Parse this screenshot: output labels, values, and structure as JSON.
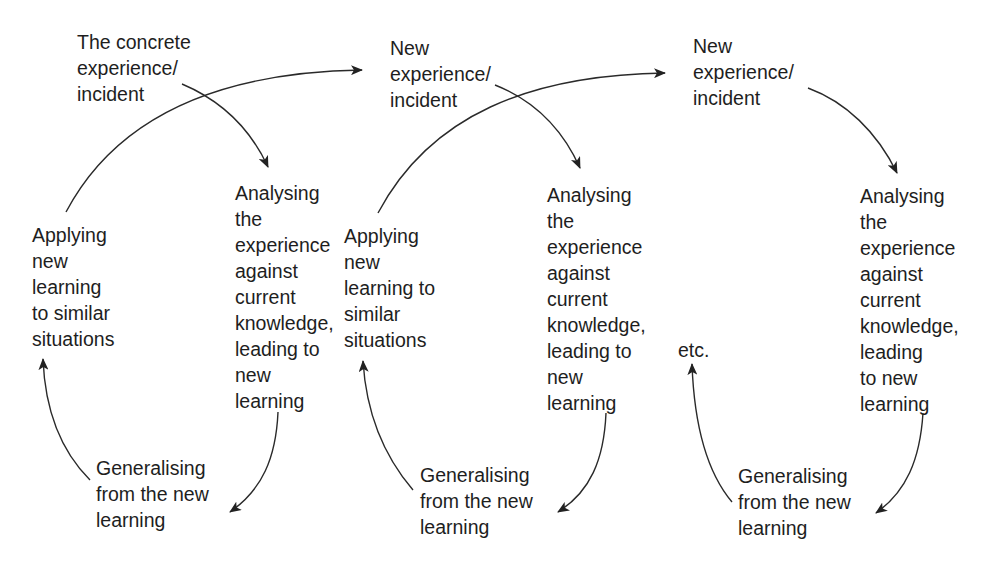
{
  "diagram": {
    "cycles": [
      {
        "experience": [
          "The concrete",
          "experience/",
          "incident"
        ],
        "analysing": [
          "Analysing",
          "the",
          "experience",
          "against",
          "current",
          "knowledge,",
          "leading to",
          "new",
          "learning"
        ],
        "generalising": [
          "Generalising",
          "from the new",
          "learning"
        ],
        "applying": [
          "Applying",
          "new",
          "learning",
          "to similar",
          "situations"
        ]
      },
      {
        "experience": [
          "New",
          "experience/",
          "incident"
        ],
        "analysing": [
          "Analysing",
          "the",
          "experience",
          "against",
          "current",
          "knowledge,",
          "leading to",
          "new",
          "learning"
        ],
        "generalising": [
          "Generalising",
          "from the new",
          "learning"
        ],
        "applying": [
          "Applying",
          "new",
          "learning to",
          "similar",
          "situations"
        ]
      },
      {
        "experience": [
          "New",
          "experience/",
          "incident"
        ],
        "analysing": [
          "Analysing",
          "the",
          "experience",
          "against",
          "current",
          "knowledge,",
          "leading",
          "to new",
          "learning"
        ],
        "generalising": [
          "Generalising",
          "from the new",
          "learning"
        ],
        "continuation": "etc."
      }
    ],
    "colors": {
      "background": "#ffffff",
      "text": "#1e1e1e",
      "arrow": "#222222"
    }
  }
}
